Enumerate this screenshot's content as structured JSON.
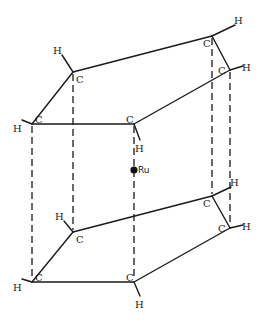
{
  "diagram": {
    "center_atom": {
      "label": "Ru",
      "x": 134,
      "y": 170
    },
    "top_ring": {
      "carbons": [
        {
          "label": "C",
          "x": 73,
          "y": 72,
          "h": {
            "label": "H",
            "x": 57,
            "y": 52
          }
        },
        {
          "label": "C",
          "x": 212,
          "y": 36,
          "h": {
            "label": "H",
            "x": 238,
            "y": 22
          }
        },
        {
          "label": "C",
          "x": 230,
          "y": 70,
          "h": {
            "label": "H",
            "x": 246,
            "y": 69
          }
        },
        {
          "label": "C",
          "x": 134,
          "y": 124,
          "h": {
            "label": "H",
            "x": 139,
            "y": 148
          }
        },
        {
          "label": "C",
          "x": 32,
          "y": 124,
          "h": {
            "label": "H",
            "x": 17,
            "y": 128
          }
        }
      ]
    },
    "bottom_ring": {
      "carbons": [
        {
          "label": "C",
          "x": 73,
          "y": 232,
          "h": {
            "label": "H",
            "x": 59,
            "y": 218
          }
        },
        {
          "label": "C",
          "x": 212,
          "y": 196,
          "h": {
            "label": "H",
            "x": 234,
            "y": 184
          }
        },
        {
          "label": "C",
          "x": 230,
          "y": 228,
          "h": {
            "label": "H",
            "x": 246,
            "y": 228
          }
        },
        {
          "label": "C",
          "x": 134,
          "y": 282,
          "h": {
            "label": "H",
            "x": 139,
            "y": 304
          }
        },
        {
          "label": "C",
          "x": 32,
          "y": 282,
          "h": {
            "label": "H",
            "x": 17,
            "y": 287
          }
        }
      ]
    },
    "labels": {
      "ru": "Ru",
      "c": "C",
      "h": "H"
    }
  }
}
